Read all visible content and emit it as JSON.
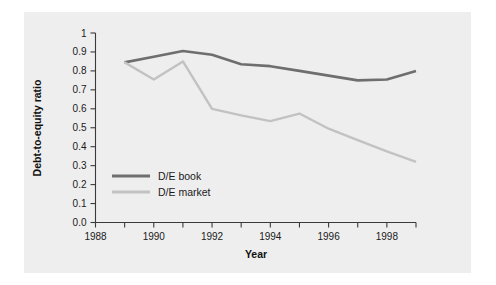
{
  "chart_data": {
    "type": "line",
    "title": "",
    "xlabel": "Year",
    "ylabel": "Debt-to-equity ratio",
    "xlim": [
      1988,
      1999
    ],
    "ylim": [
      0.0,
      1.0
    ],
    "grid": false,
    "legend_position": "inside-lower-left",
    "x_tick_labels": [
      "1988",
      "1990",
      "1992",
      "1994",
      "1996",
      "1998"
    ],
    "x_tick_values": [
      1988,
      1990,
      1992,
      1994,
      1996,
      1998
    ],
    "x_minor_tick_values": [
      1989,
      1991,
      1993,
      1995,
      1997,
      1999
    ],
    "y_tick_labels": [
      "0.0",
      "0.1",
      "0.2",
      "0.3",
      "0.4",
      "0.5",
      "0.6",
      "0.7",
      "0.8",
      "0.9",
      "1"
    ],
    "y_tick_values": [
      0.0,
      0.1,
      0.2,
      0.3,
      0.4,
      0.5,
      0.6,
      0.7,
      0.8,
      0.9,
      1.0
    ],
    "x": [
      1989,
      1990,
      1991,
      1992,
      1993,
      1994,
      1995,
      1996,
      1997,
      1998,
      1999
    ],
    "series": [
      {
        "name": "D/E book",
        "color": "#6e6e6e",
        "values": [
          0.845,
          0.875,
          0.905,
          0.885,
          0.835,
          0.825,
          0.8,
          0.775,
          0.75,
          0.755,
          0.8
        ]
      },
      {
        "name": "D/E market",
        "color": "#c2c2c2",
        "values": [
          0.845,
          0.755,
          0.85,
          0.6,
          0.565,
          0.535,
          0.575,
          0.495,
          0.435,
          0.375,
          0.32
        ]
      }
    ],
    "colors": {
      "panel_background": "#eeeeee",
      "page_background": "#ffffff",
      "axis": "#3a3a3a",
      "text": "#1a1a1a",
      "series_book": "#6e6e6e",
      "series_market": "#c2c2c2"
    }
  },
  "legend": {
    "entries": [
      {
        "label": "D/E book"
      },
      {
        "label": "D/E market"
      }
    ]
  }
}
